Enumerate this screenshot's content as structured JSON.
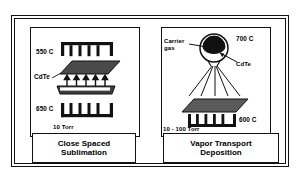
{
  "figure": {
    "panels": [
      {
        "id": "close-spaced-sublimation",
        "caption_line1": "Close Spaced",
        "caption_line2": "Sublimation",
        "labels": {
          "top_temperature": "550 C",
          "bottom_temperature": "650 C",
          "material": "CdTe",
          "pressure": "10 Torr"
        },
        "elements": [
          "top-heater-coil",
          "substrate-plate",
          "vapor-arrows",
          "source-boat",
          "bottom-heater-coil"
        ]
      },
      {
        "id": "vapor-transport-deposition",
        "caption_line1": "Vapor Transport",
        "caption_line2": "Deposition",
        "labels": {
          "carrier_gas_line1": "Carrier",
          "carrier_gas_line2": "gas",
          "source_temperature": "700 C",
          "material": "CdTe",
          "substrate_temperature": "600 C",
          "pressure": "10 - 100 Torr"
        },
        "elements": [
          "source-chamber-circle",
          "molten-source-blob",
          "carrier-gas-pointer",
          "cdte-pointer",
          "vapor-spray-lines",
          "substrate-plate",
          "heater-coil"
        ]
      }
    ],
    "colors": {
      "line": "#111111",
      "fill_dark": "#4a4a4a",
      "background": "#ffffff"
    }
  }
}
